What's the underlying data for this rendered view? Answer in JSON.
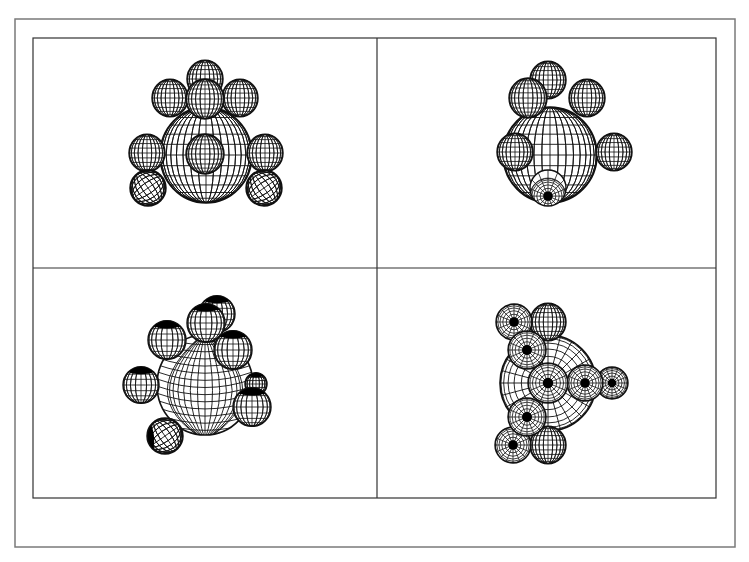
{
  "figure": {
    "outer_frame": {
      "x": 15,
      "y": 19,
      "w": 720,
      "h": 528,
      "stroke": "#7a7a7a"
    },
    "inner_frame": {
      "x": 33,
      "y": 38,
      "w": 683,
      "h": 460,
      "stroke": "#333333"
    },
    "divider": {
      "vx": 377,
      "hy": 268,
      "stroke": "#333333"
    },
    "colors": {
      "line": "#111111",
      "fill": "#ffffff",
      "pole": "#000000"
    }
  },
  "panels": [
    {
      "name": "panel-top-left",
      "big": {
        "cx": 206,
        "cy": 155,
        "r": 46,
        "style": "meridian-front",
        "rx": 46,
        "ry": 48
      },
      "spheres": [
        {
          "cx": 205,
          "cy": 79,
          "r": 18,
          "style": "front"
        },
        {
          "cx": 170,
          "cy": 98,
          "r": 18,
          "style": "front"
        },
        {
          "cx": 240,
          "cy": 98,
          "r": 18,
          "style": "front"
        },
        {
          "cx": 205,
          "cy": 99,
          "r": 19,
          "style": "front"
        },
        {
          "cx": 205,
          "cy": 154,
          "r": 19,
          "style": "front"
        },
        {
          "cx": 147,
          "cy": 153,
          "r": 18,
          "style": "front"
        },
        {
          "cx": 265,
          "cy": 153,
          "r": 18,
          "style": "front"
        },
        {
          "cx": 148,
          "cy": 188,
          "r": 18,
          "style": "tilted"
        },
        {
          "cx": 264,
          "cy": 188,
          "r": 18,
          "style": "tilted"
        }
      ]
    },
    {
      "name": "panel-top-right",
      "big": {
        "cx": 550,
        "cy": 155,
        "r": 47,
        "style": "meridian-front",
        "rx": 47,
        "ry": 48
      },
      "spheres": [
        {
          "cx": 548,
          "cy": 80,
          "r": 18,
          "style": "front"
        },
        {
          "cx": 528,
          "cy": 98,
          "r": 19,
          "style": "front"
        },
        {
          "cx": 587,
          "cy": 98,
          "r": 18,
          "style": "front"
        },
        {
          "cx": 515,
          "cy": 152,
          "r": 18,
          "style": "front"
        },
        {
          "cx": 614,
          "cy": 152,
          "r": 18,
          "style": "front"
        },
        {
          "cx": 548,
          "cy": 188,
          "r": 18,
          "style": "pole-bottom"
        }
      ]
    },
    {
      "name": "panel-bottom-left",
      "big": {
        "cx": 205,
        "cy": 385,
        "r": 48,
        "style": "tilted-big",
        "rx": 48,
        "ry": 50
      },
      "spheres": [
        {
          "cx": 256,
          "cy": 384,
          "r": 11,
          "style": "dark-top"
        },
        {
          "cx": 217,
          "cy": 314,
          "r": 18,
          "style": "dark-top"
        },
        {
          "cx": 206,
          "cy": 323,
          "r": 19,
          "style": "dark-top"
        },
        {
          "cx": 167,
          "cy": 340,
          "r": 19,
          "style": "dark-top"
        },
        {
          "cx": 233,
          "cy": 350,
          "r": 19,
          "style": "dark-top"
        },
        {
          "cx": 141,
          "cy": 385,
          "r": 18,
          "style": "dark-top"
        },
        {
          "cx": 252,
          "cy": 407,
          "r": 19,
          "style": "dark-top"
        },
        {
          "cx": 165,
          "cy": 436,
          "r": 18,
          "style": "tilted-dark"
        }
      ]
    },
    {
      "name": "panel-bottom-right",
      "big": {
        "cx": 548,
        "cy": 383,
        "r": 48,
        "style": "polar-half",
        "rx": 48,
        "ry": 48
      },
      "spheres": [
        {
          "cx": 548,
          "cy": 322,
          "r": 18,
          "style": "front"
        },
        {
          "cx": 514,
          "cy": 322,
          "r": 18,
          "style": "pole"
        },
        {
          "cx": 527,
          "cy": 350,
          "r": 19,
          "style": "pole"
        },
        {
          "cx": 612,
          "cy": 383,
          "r": 16,
          "style": "pole"
        },
        {
          "cx": 585,
          "cy": 383,
          "r": 18,
          "style": "pole"
        },
        {
          "cx": 548,
          "cy": 383,
          "r": 20,
          "style": "pole"
        },
        {
          "cx": 548,
          "cy": 445,
          "r": 18,
          "style": "front"
        },
        {
          "cx": 513,
          "cy": 445,
          "r": 18,
          "style": "pole"
        },
        {
          "cx": 527,
          "cy": 417,
          "r": 19,
          "style": "pole"
        }
      ]
    }
  ]
}
